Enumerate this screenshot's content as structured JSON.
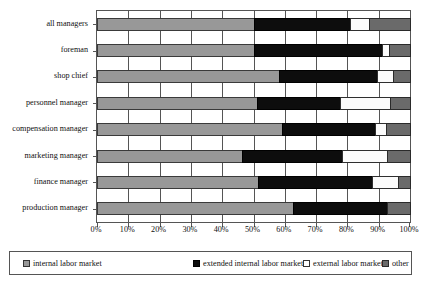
{
  "chart_data": {
    "type": "bar",
    "subtype": "horizontal-stacked-100-percent",
    "title": "",
    "xlabel": "",
    "ylabel": "",
    "xlim": [
      0,
      100
    ],
    "xticks": [
      0,
      10,
      20,
      30,
      40,
      50,
      60,
      70,
      80,
      90,
      100
    ],
    "xtick_labels": [
      "0%",
      "10%",
      "20%",
      "30%",
      "40%",
      "50%",
      "60%",
      "70%",
      "80%",
      "90%",
      "100%"
    ],
    "grid": true,
    "legend_position": "bottom",
    "categories": [
      "all managers",
      "foreman",
      "shop chief",
      "personnel manager",
      "compensation manager",
      "marketing manager",
      "finance manager",
      "production manager"
    ],
    "series": [
      {
        "name": "internal labor market",
        "color": "#989898",
        "values": [
          50.0,
          50.3,
          58.0,
          51.0,
          59.0,
          46.2,
          51.5,
          62.5
        ]
      },
      {
        "name": "extended internal labor market",
        "color": "#0d0d0d",
        "values": [
          30.7,
          40.8,
          31.4,
          26.7,
          29.8,
          32.0,
          36.4,
          30.2
        ]
      },
      {
        "name": "external labor market",
        "color": "#ffffff",
        "values": [
          6.2,
          2.3,
          5.1,
          15.9,
          3.5,
          14.5,
          8.2,
          0.0
        ]
      },
      {
        "name": "other",
        "color": "#6a6a6a",
        "values": [
          13.1,
          6.6,
          5.5,
          6.4,
          7.7,
          7.3,
          3.9,
          7.3
        ]
      }
    ]
  },
  "legend": {
    "items": [
      {
        "label": "internal labor market",
        "swatch": "swatch-internal-icon"
      },
      {
        "label": "extended internal labor market",
        "swatch": "swatch-extended-icon"
      },
      {
        "label": "external labor market",
        "swatch": "swatch-external-icon"
      },
      {
        "label": "other",
        "swatch": "swatch-other-icon"
      }
    ]
  }
}
